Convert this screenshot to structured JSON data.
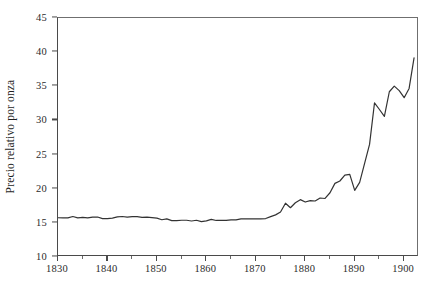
{
  "chart_data": {
    "type": "line",
    "title": "",
    "subtitle": "",
    "xlabel": "",
    "ylabel": "Precio relativo por onza",
    "xlim": [
      1830,
      1903
    ],
    "ylim": [
      10,
      45
    ],
    "grid": false,
    "legend": null,
    "legend_position": "none",
    "line_color": "#333333",
    "x_ticks": [
      1830,
      1840,
      1850,
      1860,
      1870,
      1880,
      1890,
      1900
    ],
    "x_tick_labels": [
      "1830",
      "1840",
      "1850",
      "1860",
      "1870",
      "1880",
      "1890",
      "1900"
    ],
    "x_minor_ticks": [
      1835,
      1845,
      1855,
      1865,
      1875,
      1885,
      1895
    ],
    "y_ticks": [
      10,
      15,
      20,
      25,
      30,
      35,
      40,
      45
    ],
    "y_tick_labels": [
      "10",
      "15",
      "20",
      "25",
      "30",
      "35",
      "40",
      "45"
    ],
    "series": [
      {
        "name": "Precio relativo por onza",
        "x": [
          1830,
          1831,
          1832,
          1833,
          1834,
          1835,
          1836,
          1837,
          1838,
          1839,
          1840,
          1841,
          1842,
          1843,
          1844,
          1845,
          1846,
          1847,
          1848,
          1849,
          1850,
          1851,
          1852,
          1853,
          1854,
          1855,
          1856,
          1857,
          1858,
          1859,
          1860,
          1861,
          1862,
          1863,
          1864,
          1865,
          1866,
          1867,
          1868,
          1869,
          1870,
          1871,
          1872,
          1873,
          1874,
          1875,
          1876,
          1877,
          1878,
          1879,
          1880,
          1881,
          1882,
          1883,
          1884,
          1885,
          1886,
          1887,
          1888,
          1889,
          1890,
          1891,
          1892,
          1893,
          1894,
          1895,
          1896,
          1897,
          1898,
          1899,
          1900,
          1901,
          1902
        ],
        "values": [
          15.75,
          15.72,
          15.73,
          15.93,
          15.73,
          15.8,
          15.72,
          15.83,
          15.85,
          15.62,
          15.62,
          15.7,
          15.87,
          15.93,
          15.85,
          15.92,
          15.9,
          15.8,
          15.85,
          15.78,
          15.7,
          15.46,
          15.59,
          15.33,
          15.33,
          15.38,
          15.38,
          15.27,
          15.38,
          15.19,
          15.29,
          15.5,
          15.35,
          15.37,
          15.37,
          15.44,
          15.43,
          15.57,
          15.59,
          15.6,
          15.57,
          15.57,
          15.63,
          15.92,
          16.17,
          16.59,
          17.88,
          17.22,
          17.94,
          18.4,
          18.05,
          18.25,
          18.2,
          18.64,
          18.57,
          19.41,
          20.78,
          21.13,
          21.99,
          22.1,
          19.76,
          20.92,
          23.72,
          26.49,
          32.56,
          31.6,
          30.59,
          34.2,
          35.03,
          34.36,
          33.33,
          34.68,
          39.15
        ],
        "color": "#333333",
        "width": 1.2
      }
    ],
    "annotations": []
  },
  "axes": {
    "y_title": "Precio relativo por onza"
  }
}
